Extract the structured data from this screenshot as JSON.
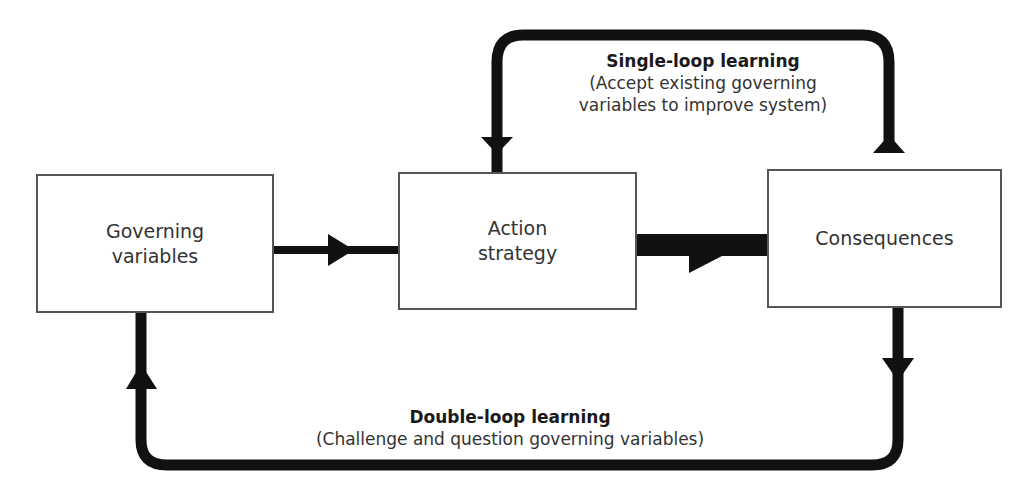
{
  "diagram": {
    "colors": {
      "arrow": "#111111",
      "box_border": "#555555",
      "text": "#333333",
      "background": "#ffffff"
    },
    "nodes": [
      {
        "id": "governing-variables",
        "label": "Governing\nvariables"
      },
      {
        "id": "action-strategy",
        "label": "Action\nstrategy"
      },
      {
        "id": "consequences",
        "label": "Consequences"
      }
    ],
    "edges": [
      {
        "from": "governing-variables",
        "to": "action-strategy",
        "style": "medium"
      },
      {
        "from": "action-strategy",
        "to": "consequences",
        "style": "thick"
      },
      {
        "from": "consequences",
        "to": "action-strategy",
        "style": "loop-top",
        "label": "single_loop"
      },
      {
        "from": "consequences",
        "to": "governing-variables",
        "style": "loop-bottom",
        "label": "double_loop"
      }
    ],
    "single_loop": {
      "title": "Single-loop learning",
      "description": "(Accept existing governing\nvariables to improve system)"
    },
    "double_loop": {
      "title": "Double-loop learning",
      "description": "(Challenge and question governing variables)"
    }
  }
}
